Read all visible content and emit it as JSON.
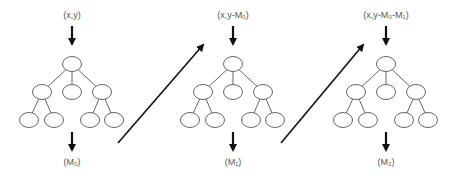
{
  "stages": [
    {
      "input_label": "(x,y)",
      "output_label": "(M₀)",
      "cx": 72
    },
    {
      "input_label": "(x,y-M₀)",
      "output_label": "(M₁)",
      "cx": 233
    },
    {
      "input_label": "(x,y-M₀-M₁)",
      "output_label": "(M₂)",
      "cx": 386
    }
  ],
  "transitions": [
    {
      "from": "stage-0",
      "to": "stage-1"
    },
    {
      "from": "stage-1",
      "to": "stage-2"
    }
  ],
  "colors": {
    "stroke": "#111111",
    "node_stroke": "#555555",
    "text": "#555555"
  }
}
